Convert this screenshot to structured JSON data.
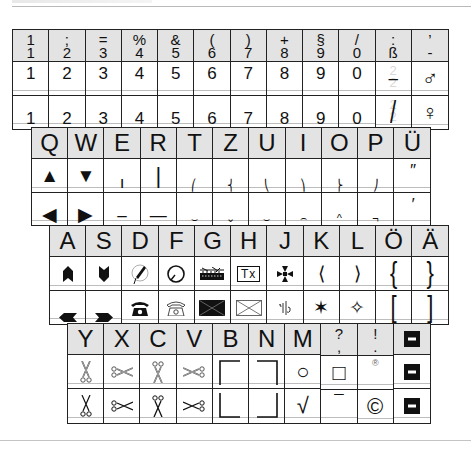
{
  "colors": {
    "header_bg": "#e3e3e3",
    "border": "#222222",
    "baseline": "#bdbdbd",
    "ghost": "#d8d8d8"
  },
  "rows": [
    {
      "name": "number-row",
      "keys": [
        {
          "upper": "1",
          "lower": "1",
          "sub1": "1",
          "sub2": "1"
        },
        {
          "upper": ";",
          "lower": "2",
          "sub1": "2",
          "sub2": "2"
        },
        {
          "upper": "=",
          "lower": "3",
          "sub1": "3",
          "sub2": "3"
        },
        {
          "upper": "%",
          "lower": "4",
          "sub1": "4",
          "sub2": "4"
        },
        {
          "upper": "&",
          "lower": "5",
          "sub1": "5",
          "sub2": "5"
        },
        {
          "upper": "(",
          "lower": "6",
          "sub1": "6",
          "sub2": "6"
        },
        {
          "upper": ")",
          "lower": "7",
          "sub1": "7",
          "sub2": "7"
        },
        {
          "upper": "+",
          "lower": "8",
          "sub1": "8",
          "sub2": "8"
        },
        {
          "upper": "§",
          "lower": "9",
          "sub1": "9",
          "sub2": "9"
        },
        {
          "upper": "/",
          "lower": "0",
          "sub1": "0",
          "sub2": "0"
        },
        {
          "upper": ":",
          "lower": "ß",
          "sub1": "–",
          "sub2": "/",
          "ghost_top": "2",
          "ghost_bottom": "2"
        },
        {
          "upper": "’",
          "lower": "-",
          "sub1": "♂",
          "sub2": "♀"
        }
      ]
    },
    {
      "name": "qwertz-row",
      "keys": [
        {
          "label": "Q",
          "sub1": "▲",
          "sub2": "◀"
        },
        {
          "label": "W",
          "sub1": "▼",
          "sub2": "▶"
        },
        {
          "label": "E",
          "sub1": "ı",
          "sub2": "–"
        },
        {
          "label": "R",
          "sub1": "|",
          "sub2": "—"
        },
        {
          "label": "T",
          "sub1": "⎛",
          "sub2": "⌣"
        },
        {
          "label": "Z",
          "sub1": "⎨",
          "sub2": "⌄"
        },
        {
          "label": "U",
          "sub1": "⎝",
          "sub2": "⌣"
        },
        {
          "label": "I",
          "sub1": "⎞",
          "sub2": "⌢"
        },
        {
          "label": "O",
          "sub1": "⎬",
          "sub2": "^"
        },
        {
          "label": "P",
          "sub1": "⎠",
          "sub2": "¬"
        },
        {
          "label": "Ü",
          "sub1": "″",
          "sub2": "′"
        }
      ]
    },
    {
      "name": "asdf-row",
      "keys": [
        {
          "label": "A",
          "sub1": "arrow-up-chevron",
          "sub2": "arrow-left-chevron"
        },
        {
          "label": "S",
          "sub1": "arrow-down-chevron",
          "sub2": "arrow-right-chevron"
        },
        {
          "label": "D",
          "sub1": "handset-circle",
          "sub2": "telephone-filled"
        },
        {
          "label": "F",
          "sub1": "circle-loop",
          "sub2": "telephone-outline"
        },
        {
          "label": "G",
          "sub1": "teleprinter",
          "sub2": "envelope-filled"
        },
        {
          "label": "H",
          "sub1": "Tx",
          "sub2": "envelope-outline"
        },
        {
          "label": "J",
          "sub1": "maltese-cross",
          "sub2": "ligature-sign"
        },
        {
          "label": "K",
          "sub1": "⟨",
          "sub2": "✶"
        },
        {
          "label": "L",
          "sub1": "⟩",
          "sub2": "✧"
        },
        {
          "label": "Ö",
          "sub1": "{",
          "sub2": "["
        },
        {
          "label": "Ä",
          "sub1": "}",
          "sub2": "]"
        }
      ]
    },
    {
      "name": "yxcv-row",
      "keys": [
        {
          "label": "Y",
          "sub1": "scissors-vertical-outline",
          "sub2": "scissors-vertical"
        },
        {
          "label": "X",
          "sub1": "scissors-horizontal-outline",
          "sub2": "scissors-horizontal"
        },
        {
          "label": "C",
          "sub1": "scissors-vertical-outline",
          "sub2": "scissors-vertical"
        },
        {
          "label": "V",
          "sub1": "scissors-horizontal-outline",
          "sub2": "scissors-horizontal"
        },
        {
          "label": "B",
          "sub1": "⌜",
          "sub2": "⌞"
        },
        {
          "label": "N",
          "sub1": "⌝",
          "sub2": "⌟"
        },
        {
          "label": "M",
          "sub1": "○",
          "sub2": "√"
        },
        {
          "upper": "?",
          "lower": ",",
          "sub1": "□",
          "sub2": "¯"
        },
        {
          "upper": "!",
          "lower": ".",
          "sub1": "®",
          "sub2": "©"
        },
        {
          "label": "■",
          "sub1": "■",
          "sub2": "■"
        }
      ]
    }
  ]
}
